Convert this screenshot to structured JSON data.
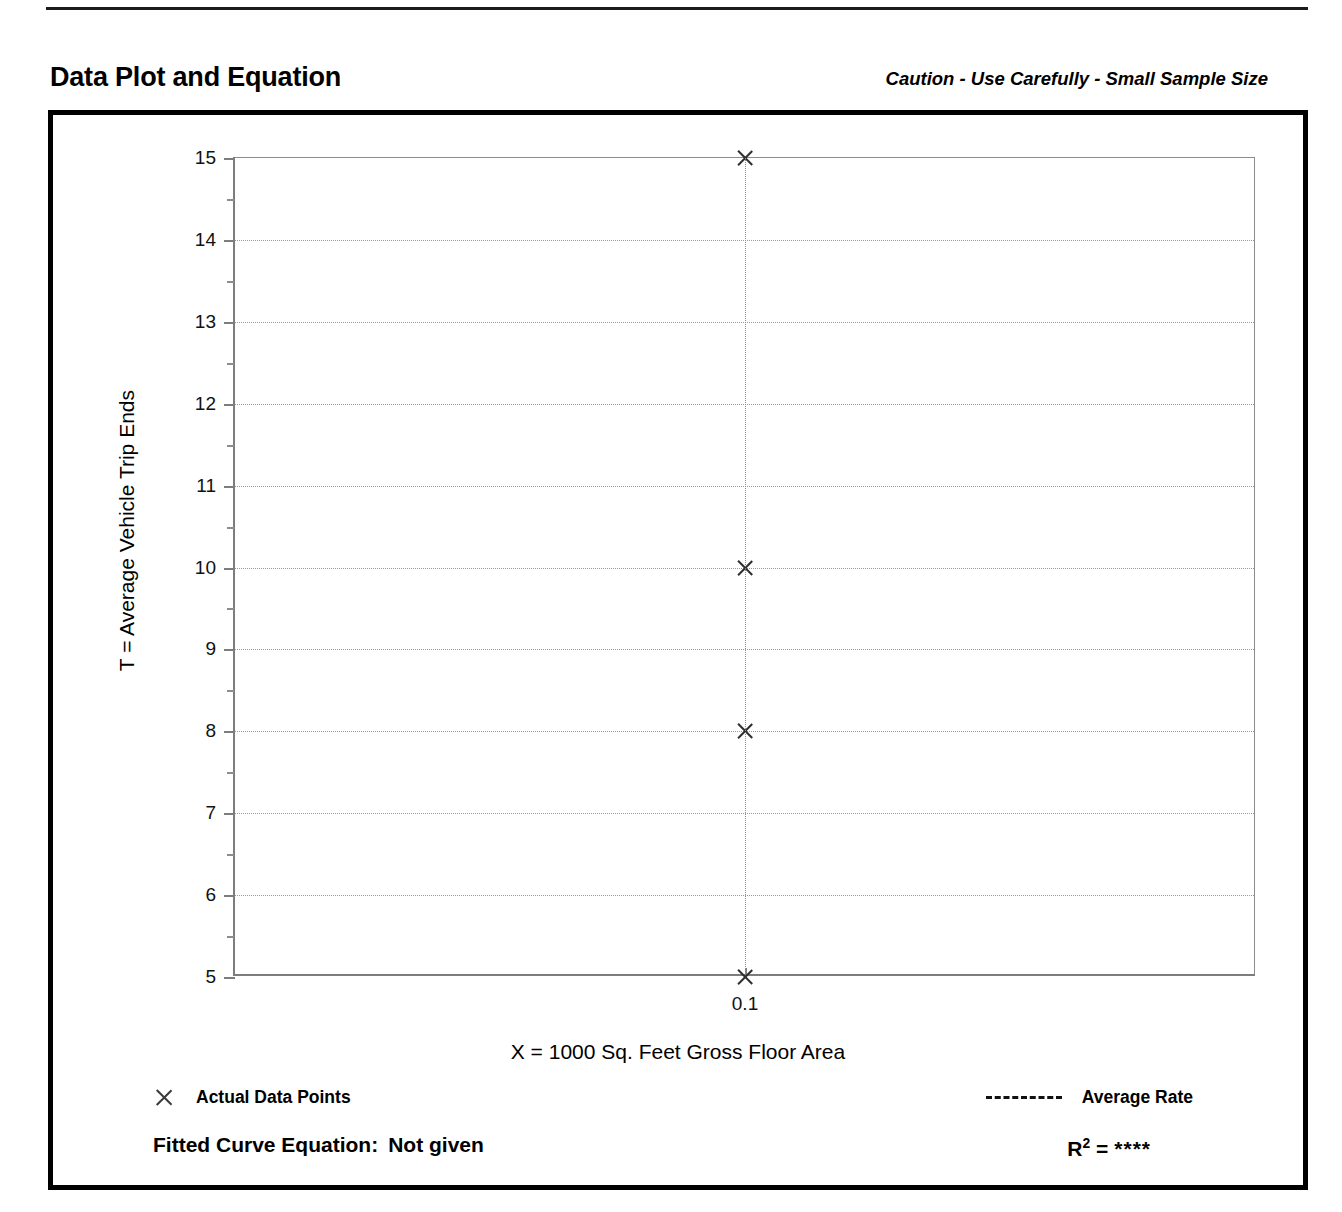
{
  "header": {
    "title": "Data Plot and Equation",
    "caution": "Caution - Use Carefully - Small Sample Size"
  },
  "legend": {
    "data_points_label": "Actual Data Points",
    "data_points_marker": "x-marker-icon",
    "average_rate_label": "Average Rate",
    "average_rate_marker": "dashed-line-icon"
  },
  "equation": {
    "fitted_label": "Fitted Curve Equation:",
    "fitted_value": "Not given",
    "r_label": "R",
    "r_exponent": "2",
    "r_equals": "=",
    "r_value": "****"
  },
  "chart_data": {
    "type": "scatter",
    "title": "Data Plot and Equation",
    "subtitle": "Caution - Use Carefully - Small Sample Size",
    "xlabel": "X = 1000 Sq. Feet Gross Floor Area",
    "ylabel": "T = Average Vehicle Trip Ends",
    "xlim": [
      0.0,
      0.2
    ],
    "ylim": [
      5,
      15
    ],
    "x_ticks": [
      0.1
    ],
    "x_tick_labels": [
      "0.1"
    ],
    "y_ticks": [
      5,
      6,
      7,
      8,
      9,
      10,
      11,
      12,
      13,
      14,
      15
    ],
    "y_tick_labels": [
      "5",
      "6",
      "7",
      "8",
      "9",
      "10",
      "11",
      "12",
      "13",
      "14",
      "15"
    ],
    "y_minor_ticks": [
      5.5,
      6.5,
      7.5,
      8.5,
      9.5,
      10.5,
      11.5,
      12.5,
      13.5,
      14.5
    ],
    "grid": true,
    "grid_style": "dotted",
    "legend_position": "below-plot",
    "series": [
      {
        "name": "Actual Data Points",
        "marker": "x",
        "points": [
          {
            "x": 0.1,
            "y": 15
          },
          {
            "x": 0.1,
            "y": 10
          },
          {
            "x": 0.1,
            "y": 8
          },
          {
            "x": 0.1,
            "y": 5
          }
        ]
      },
      {
        "name": "Average Rate",
        "style": "dashed-vertical",
        "x": 0.1
      }
    ],
    "colors": {
      "marker": "#2e2e2e",
      "grid": "#9a9a9a",
      "axis": "#7d7d7d",
      "frame": "#000000"
    }
  }
}
